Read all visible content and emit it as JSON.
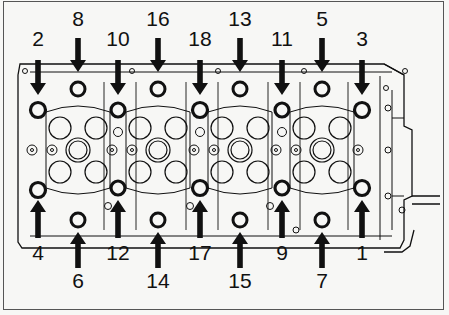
{
  "diagram": {
    "type": "cylinder-head-bolt-tightening-sequence",
    "colors": {
      "ink": "#111111",
      "paper": "#f7f7f5",
      "frame": "#555555"
    },
    "top_labels": [
      {
        "label": "2",
        "x": 38,
        "y": 58,
        "arrow": "tall"
      },
      {
        "label": "8",
        "x": 78,
        "y": 30,
        "arrow": "short"
      },
      {
        "label": "10",
        "x": 118,
        "y": 58,
        "arrow": "tall"
      },
      {
        "label": "16",
        "x": 158,
        "y": 30,
        "arrow": "short"
      },
      {
        "label": "18",
        "x": 200,
        "y": 58,
        "arrow": "tall"
      },
      {
        "label": "13",
        "x": 240,
        "y": 30,
        "arrow": "short"
      },
      {
        "label": "11",
        "x": 282,
        "y": 58,
        "arrow": "tall"
      },
      {
        "label": "5",
        "x": 322,
        "y": 30,
        "arrow": "short"
      },
      {
        "label": "3",
        "x": 362,
        "y": 58,
        "arrow": "tall"
      }
    ],
    "bottom_labels": [
      {
        "label": "4",
        "x": 38,
        "y": 238,
        "arrow": "tall"
      },
      {
        "label": "6",
        "x": 78,
        "y": 270,
        "arrow": "short"
      },
      {
        "label": "12",
        "x": 118,
        "y": 238,
        "arrow": "tall"
      },
      {
        "label": "14",
        "x": 158,
        "y": 270,
        "arrow": "short"
      },
      {
        "label": "17",
        "x": 200,
        "y": 238,
        "arrow": "tall"
      },
      {
        "label": "15",
        "x": 240,
        "y": 270,
        "arrow": "short"
      },
      {
        "label": "9",
        "x": 282,
        "y": 238,
        "arrow": "tall"
      },
      {
        "label": "7",
        "x": 322,
        "y": 270,
        "arrow": "short"
      },
      {
        "label": "1",
        "x": 362,
        "y": 238,
        "arrow": "tall"
      }
    ],
    "sequence_order": [
      "1",
      "2",
      "3",
      "4",
      "5",
      "6",
      "7",
      "8",
      "9",
      "10",
      "11",
      "12",
      "13",
      "14",
      "15",
      "16",
      "17",
      "18"
    ]
  }
}
